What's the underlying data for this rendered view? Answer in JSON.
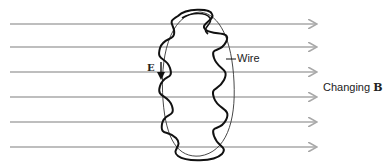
{
  "diagram": {
    "type": "induced-emf-loop",
    "field_lines": {
      "count": 6,
      "direction": "right",
      "color": "#a8a8a8",
      "y_positions": [
        24,
        47,
        72,
        97,
        122,
        147
      ],
      "x_start": 10,
      "x_end": 316
    },
    "loop": {
      "color": "#111111"
    },
    "labels": {
      "wire": "Wire",
      "changing_prefix": "Changing ",
      "field_symbol": "B",
      "efield_symbol": "E"
    }
  }
}
